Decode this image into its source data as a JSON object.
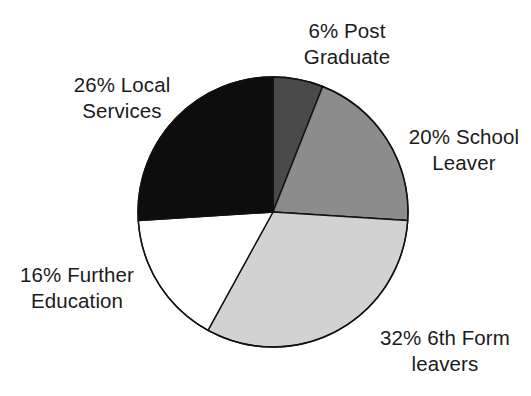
{
  "chart_data": {
    "type": "pie",
    "title": "",
    "subtitle": "",
    "xlabel": "",
    "ylabel": "",
    "legend_position": "none",
    "grid": false,
    "units": "percent",
    "start_angle_deg": 0,
    "direction": "clockwise",
    "categories": [
      "Post Graduate",
      "School Leaver",
      "6th Form leavers",
      "Further Education",
      "Local Services"
    ],
    "values": [
      6,
      20,
      32,
      16,
      26
    ],
    "slices": [
      {
        "label": "6% Post\nGraduate",
        "category": "Post Graduate",
        "value": 6,
        "percent_text": "6%",
        "color": "#4a4a4a",
        "label_position": "top"
      },
      {
        "label": "20% School\nLeaver",
        "category": "School Leaver",
        "value": 20,
        "percent_text": "20%",
        "color": "#8c8c8c",
        "label_position": "right"
      },
      {
        "label": "32% 6th Form\nleavers",
        "category": "6th Form leavers",
        "value": 32,
        "percent_text": "32%",
        "color": "#d2d2d2",
        "label_position": "bottom-right"
      },
      {
        "label": "16% Further\nEducation",
        "category": "Further Education",
        "value": 16,
        "percent_text": "16%",
        "color": "#ffffff",
        "label_position": "left"
      },
      {
        "label": "26% Local\nServices",
        "category": "Local Services",
        "value": 26,
        "percent_text": "26%",
        "color": "#0d0d0d",
        "label_position": "top-left"
      }
    ],
    "outline_color": "#111111",
    "background_color": "#ffffff"
  },
  "geometry": {
    "center_x": 273,
    "center_y": 212,
    "radius": 135
  }
}
